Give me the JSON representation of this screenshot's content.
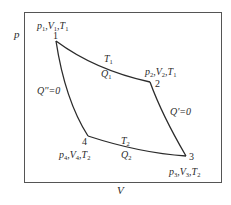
{
  "diagram": {
    "axes": {
      "y_label": "p",
      "x_label": "V"
    },
    "points": [
      {
        "id": "1",
        "state": {
          "p": "p",
          "p_sub": "1",
          "V": "V",
          "V_sub": "1",
          "T": "T",
          "T_sub": "1"
        }
      },
      {
        "id": "2",
        "state": {
          "p": "p",
          "p_sub": "2",
          "V": "V",
          "V_sub": "2",
          "T": "T",
          "T_sub": "1"
        }
      },
      {
        "id": "3",
        "state": {
          "p": "p",
          "p_sub": "3",
          "V": "V",
          "V_sub": "3",
          "T": "T",
          "T_sub": "2"
        }
      },
      {
        "id": "4",
        "state": {
          "p": "p",
          "p_sub": "4",
          "V": "V",
          "V_sub": "4",
          "T": "T",
          "T_sub": "2"
        }
      }
    ],
    "processes": {
      "top": {
        "temp": "T",
        "temp_sub": "1",
        "heat": "Q",
        "heat_sub": "1"
      },
      "bottom": {
        "temp": "T",
        "temp_sub": "2",
        "heat": "Q",
        "heat_sub": "2"
      },
      "right": {
        "heat_label": "Q'=0"
      },
      "left": {
        "heat_label": "Q''=0"
      }
    },
    "colors": {
      "line": "#2b2b2b",
      "frame": "#555555",
      "background": "#ffffff"
    }
  }
}
